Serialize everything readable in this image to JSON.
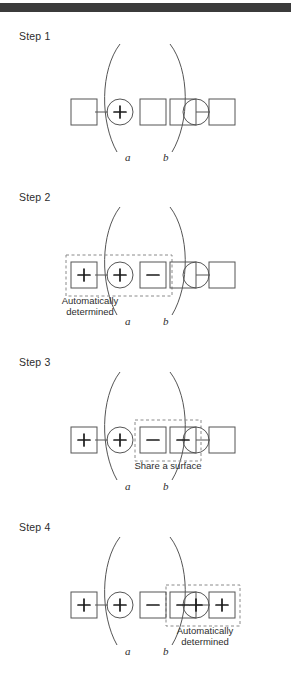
{
  "figure": {
    "type": "diagram",
    "header_bar_color": "#3b3b3b",
    "line_color": "#555555",
    "text_color": "#2d2d2d",
    "dashed_color": "#8a8a8a"
  },
  "steps": [
    {
      "id": "step-1",
      "label": "Step 1",
      "nodes": [
        {
          "shape": "square",
          "sign": ""
        },
        {
          "shape": "circle",
          "sign": "+"
        },
        {
          "shape": "square",
          "sign": ""
        },
        {
          "shape": "square",
          "sign": ""
        },
        {
          "shape": "circle",
          "sign": ""
        },
        {
          "shape": "square",
          "sign": ""
        }
      ],
      "connectors": [
        "1-2",
        "5-6"
      ],
      "arc_labels": [
        "a",
        "b"
      ],
      "dashed_box": null,
      "caption": null
    },
    {
      "id": "step-2",
      "label": "Step 2",
      "nodes": [
        {
          "shape": "square",
          "sign": "+"
        },
        {
          "shape": "circle",
          "sign": "+"
        },
        {
          "shape": "square",
          "sign": "−"
        },
        {
          "shape": "square",
          "sign": ""
        },
        {
          "shape": "circle",
          "sign": ""
        },
        {
          "shape": "square",
          "sign": ""
        }
      ],
      "connectors": [
        "1-2",
        "5-6"
      ],
      "arc_labels": [
        "a",
        "b"
      ],
      "dashed_box": {
        "covers": [
          1,
          2,
          3
        ],
        "position": "left"
      },
      "caption": {
        "lines": [
          "Automatically",
          "determined"
        ],
        "position": "below-left"
      }
    },
    {
      "id": "step-3",
      "label": "Step 3",
      "nodes": [
        {
          "shape": "square",
          "sign": "+"
        },
        {
          "shape": "circle",
          "sign": "+"
        },
        {
          "shape": "square",
          "sign": "−"
        },
        {
          "shape": "square",
          "sign": "−"
        },
        {
          "shape": "circle",
          "sign": ""
        },
        {
          "shape": "square",
          "sign": ""
        }
      ],
      "connectors": [
        "1-2",
        "5-6"
      ],
      "arc_labels": [
        "a",
        "b"
      ],
      "dashed_box": {
        "covers": [
          3,
          4
        ],
        "position": "middle"
      },
      "caption": {
        "lines": [
          "Share a surface"
        ],
        "position": "below-middle"
      }
    },
    {
      "id": "step-4",
      "label": "Step 4",
      "nodes": [
        {
          "shape": "square",
          "sign": "+"
        },
        {
          "shape": "circle",
          "sign": "+"
        },
        {
          "shape": "square",
          "sign": "−"
        },
        {
          "shape": "square",
          "sign": "−"
        },
        {
          "shape": "circle",
          "sign": "+"
        },
        {
          "shape": "square",
          "sign": "+"
        }
      ],
      "connectors": [
        "1-2",
        "5-6"
      ],
      "arc_labels": [
        "a",
        "b"
      ],
      "dashed_box": {
        "covers": [
          4,
          5,
          6
        ],
        "position": "right"
      },
      "caption": {
        "lines": [
          "Automatically",
          "determined"
        ],
        "position": "below-right"
      }
    }
  ]
}
